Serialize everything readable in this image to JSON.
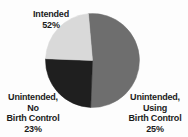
{
  "figure": {
    "background_color": "#fdfdfd",
    "text_color": "#1b1b1b"
  },
  "chart_data": {
    "type": "pie",
    "title": "",
    "subtitle": "",
    "xlabel": "",
    "ylabel": "",
    "grid": false,
    "legend_position": "none",
    "labels_position": "outside",
    "total_percent": 100,
    "categories": [
      "Intended",
      "Unintended, Using Birth Control",
      "Unintended, No Birth Control"
    ],
    "values": [
      52,
      25,
      23
    ],
    "colors": [
      "#6e6e6e",
      "#1f1f1f",
      "#d9d9d9"
    ],
    "slices": [
      {
        "name": "intended",
        "percent_value": 52,
        "percent_text": "52%",
        "color": "#6e6e6e",
        "start_angle_deg": 265,
        "sweep_deg": 187.2,
        "label_lines": [
          "Intended",
          "52%"
        ]
      },
      {
        "name": "unintended-using-birth-control",
        "percent_value": 25,
        "percent_text": "25%",
        "color": "#1f1f1f",
        "start_angle_deg": 92.2,
        "sweep_deg": 90,
        "label_lines": [
          "Unintended,",
          "Using",
          "Birth Control",
          "25%"
        ]
      },
      {
        "name": "unintended-no-birth-control",
        "percent_value": 23,
        "percent_text": "23%",
        "color": "#d9d9d9",
        "start_angle_deg": 182.2,
        "sweep_deg": 82.8,
        "label_lines": [
          "Unintended,",
          "No",
          "Birth Control",
          "23%"
        ]
      }
    ]
  },
  "labels": {
    "intended": {
      "line1": "Intended",
      "line2": "52%"
    },
    "no_birth_control": {
      "line1": "Unintended,",
      "line2": "No",
      "line3": "Birth Control",
      "line4": "23%"
    },
    "using_birth_control": {
      "line1": "Unintended,",
      "line2": "Using",
      "line3": "Birth Control",
      "line4": "25%"
    }
  }
}
